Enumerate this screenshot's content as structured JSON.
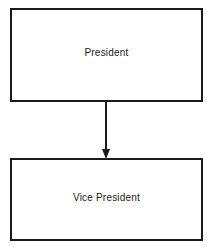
{
  "diagram": {
    "type": "org-chart",
    "nodes": [
      {
        "id": "president",
        "label": "President"
      },
      {
        "id": "vice-president",
        "label": "Vice President"
      }
    ],
    "edges": [
      {
        "from": "president",
        "to": "vice-president",
        "style": "arrow"
      }
    ],
    "colors": {
      "line": "#1a1a1a",
      "background": "#ffffff"
    }
  }
}
